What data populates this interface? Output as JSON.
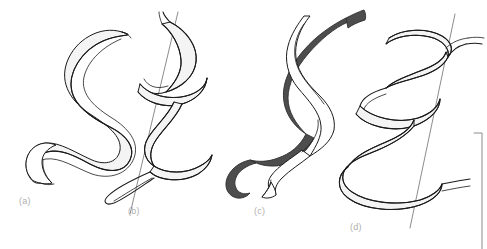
{
  "figure": {
    "background_color": "#ffffff",
    "width": 487,
    "height": 249,
    "stroke_color": "#1a1a1a",
    "ribbon_fill_light": "#ffffff",
    "ribbon_fill_shade": "#f2f2f2",
    "ribbon_fill_dark": "#4d4d4d",
    "axis_line_color": "#8c8c8c",
    "label_color": "#b0b0b0",
    "rule_color": "#8c8c8c"
  },
  "panels": [
    {
      "id": "a",
      "label": "(a)",
      "description": "relaxed open S-shaped flat ribbon, no writhe",
      "has_axis_line": false,
      "ribbon_count": 1,
      "ribbon_colors": [
        "#ffffff"
      ]
    },
    {
      "id": "b",
      "label": "(b)",
      "description": "single ribbon coiled into a tight right-handed helix around a straight axis",
      "has_axis_line": true,
      "ribbon_count": 1,
      "ribbon_colors": [
        "#ffffff"
      ]
    },
    {
      "id": "c",
      "label": "(c)",
      "description": "two ribbons plectonemically intertwined as a double helix, one dark one light",
      "has_axis_line": false,
      "ribbon_count": 2,
      "ribbon_colors": [
        "#4d4d4d",
        "#ffffff"
      ]
    },
    {
      "id": "d",
      "label": "(d)",
      "description": "single ribbon wound as a wide-pitch solenoidal supercoil about a straight axis",
      "has_axis_line": true,
      "ribbon_count": 1,
      "ribbon_colors": [
        "#ffffff"
      ]
    }
  ],
  "margin_rule": {
    "name": "right-margin-rule",
    "visible": true,
    "orientation": "vertical",
    "has_top_tick": true
  }
}
